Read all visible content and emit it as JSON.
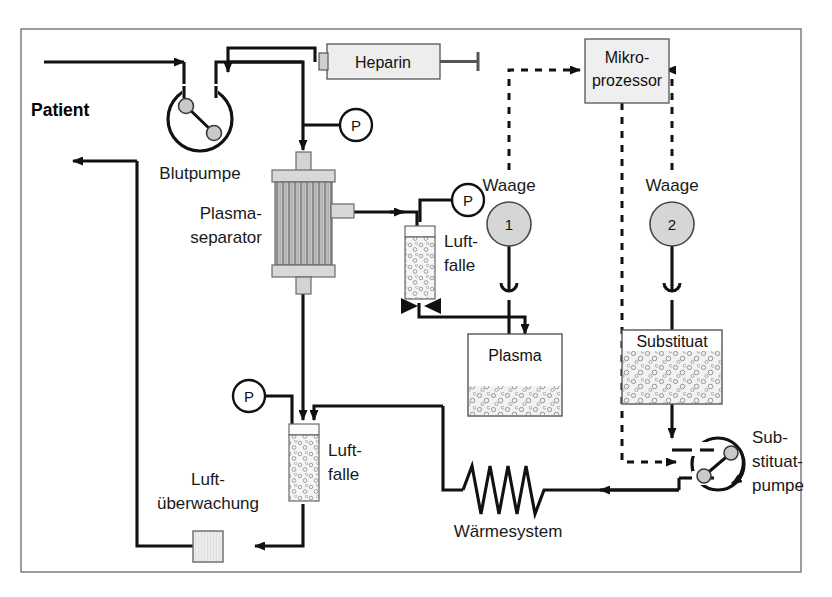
{
  "diagram": {
    "frame_color": "#555555",
    "line_color": "#111111",
    "fill_gray": "#d8d8d8",
    "accent_gray": "#b8b8b8"
  },
  "labels": {
    "patient": "Patient",
    "blutpumpe": "Blutpumpe",
    "plasma_separator_line1": "Plasma-",
    "plasma_separator_line2": "separator",
    "heparin": "Heparin",
    "mikroprozessor_line1": "Mikro-",
    "mikroprozessor_line2": "prozessor",
    "waage1": "Waage",
    "waage2": "Waage",
    "waage1_number": "1",
    "waage2_number": "2",
    "luftfalle_top_line1": "Luft-",
    "luftfalle_top_line2": "falle",
    "luftfalle_bottom_line1": "Luft-",
    "luftfalle_bottom_line2": "falle",
    "plasma": "Plasma",
    "substituat": "Substituat",
    "substituatpumpe_line1": "Sub-",
    "substituatpumpe_line2": "stituat-",
    "substituatpumpe_line3": "pumpe",
    "waermesystem": "Wärmesystem",
    "luftueberwachung_line1": "Luft-",
    "luftueberwachung_line2": "überwachung",
    "pressure_sensor": "P"
  },
  "components": [
    {
      "name": "patient-access",
      "label": "Patient",
      "type": "io-port"
    },
    {
      "name": "blood-pump",
      "label": "Blutpumpe",
      "type": "roller-pump"
    },
    {
      "name": "heparin-syringe",
      "label": "Heparin",
      "type": "syringe"
    },
    {
      "name": "plasma-separator",
      "label": "Plasma-separator",
      "type": "filter"
    },
    {
      "name": "pressure-sensor-arterial",
      "label": "P",
      "type": "sensor"
    },
    {
      "name": "pressure-sensor-plasma",
      "label": "P",
      "type": "sensor"
    },
    {
      "name": "pressure-sensor-venous",
      "label": "P",
      "type": "sensor"
    },
    {
      "name": "air-trap-plasma",
      "label": "Luft-falle",
      "type": "air-trap"
    },
    {
      "name": "air-trap-venous",
      "label": "Luft-falle",
      "type": "air-trap"
    },
    {
      "name": "microprocessor",
      "label": "Mikro-prozessor",
      "type": "controller"
    },
    {
      "name": "scale-1",
      "label": "Waage 1",
      "type": "scale"
    },
    {
      "name": "scale-2",
      "label": "Waage 2",
      "type": "scale"
    },
    {
      "name": "plasma-container",
      "label": "Plasma",
      "type": "container"
    },
    {
      "name": "substituate-container",
      "label": "Substituat",
      "type": "container"
    },
    {
      "name": "substituate-pump",
      "label": "Substituatpumpe",
      "type": "roller-pump"
    },
    {
      "name": "heating-system",
      "label": "Wärmesystem",
      "type": "heater"
    },
    {
      "name": "air-detector",
      "label": "Luftüberwachung",
      "type": "detector"
    }
  ]
}
